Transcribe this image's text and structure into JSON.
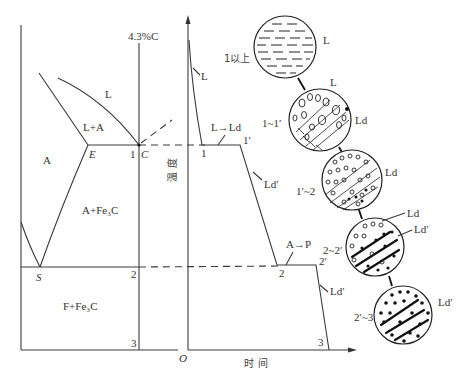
{
  "diagram": {
    "phase_diagram": {
      "composition_label": "4.3%C",
      "points": {
        "E": "E",
        "C": "C",
        "S": "S"
      },
      "regions": {
        "L": "L",
        "L_A": "L+A",
        "A": "A",
        "A_Fe3C": "A+Fe₃C",
        "F_Fe3C": "F+Fe₃C"
      },
      "markers": {
        "p1": "1",
        "p2": "2",
        "p3": "3"
      }
    },
    "cooling_curve": {
      "y_axis_label": "温 度",
      "x_axis_label": "时 间",
      "origin": "O",
      "labels": {
        "L": "L",
        "L_to_Ld": "L→Ld",
        "Ld_prime_1": "Ld′",
        "A_to_P": "A→P",
        "Ld_prime_2": "Ld′"
      },
      "points": {
        "p1": "1",
        "p1p": "1′",
        "p2": "2",
        "p2p": "2′",
        "p3": "3"
      }
    },
    "microstructures": [
      {
        "stage": "1以上",
        "labels": [
          "L"
        ]
      },
      {
        "stage": "1~1′",
        "labels": [
          "L",
          "Ld"
        ]
      },
      {
        "stage": "1′~2",
        "labels": [
          "Ld"
        ]
      },
      {
        "stage": "2~2′",
        "labels": [
          "Ld",
          "Ld′"
        ]
      },
      {
        "stage": "2′~3",
        "labels": [
          "Ld′"
        ]
      }
    ]
  }
}
